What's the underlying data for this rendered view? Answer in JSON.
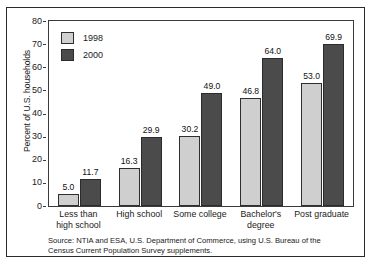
{
  "chart_data": {
    "type": "bar",
    "title": "",
    "subtitle": "",
    "xlabel": "",
    "ylabel": "Percent of U.S. households",
    "ylim": [
      0,
      80
    ],
    "ytick_step": 10,
    "yticks": [
      "0",
      "10",
      "20",
      "30",
      "40",
      "50",
      "60",
      "70",
      "80"
    ],
    "grid": false,
    "legend_position": "top-left-inside",
    "categories": [
      "Less than high school",
      "High school",
      "Some college",
      "Bachelor's degree",
      "Post graduate"
    ],
    "category_lines": [
      [
        "Less than",
        "high school"
      ],
      [
        "High school"
      ],
      [
        "Some college"
      ],
      [
        "Bachelor's",
        "degree"
      ],
      [
        "Post graduate"
      ]
    ],
    "series": [
      {
        "name": "1998",
        "color": "#cfcfcf",
        "values": [
          5.0,
          16.3,
          30.2,
          46.8,
          53.0
        ],
        "labels": [
          "5.0",
          "16.3",
          "30.2",
          "46.8",
          "53.0"
        ]
      },
      {
        "name": "2000",
        "color": "#4b4b4b",
        "values": [
          11.7,
          29.9,
          49.0,
          64.0,
          69.9
        ],
        "labels": [
          "11.7",
          "29.9",
          "49.0",
          "64.0",
          "69.9"
        ]
      }
    ],
    "annotations": [
      "Source: NTIA and ESA, U.S. Department of Commerce, using U.S. Bureau of the Census Current Population Survey supplements."
    ]
  },
  "legend": {
    "items": [
      {
        "label": "1998",
        "color": "#cfcfcf"
      },
      {
        "label": "2000",
        "color": "#4b4b4b"
      }
    ]
  },
  "source_note": "Source: NTIA and ESA, U.S. Department of Commerce, using U.S. Bureau of the Census Current Population Survey supplements."
}
